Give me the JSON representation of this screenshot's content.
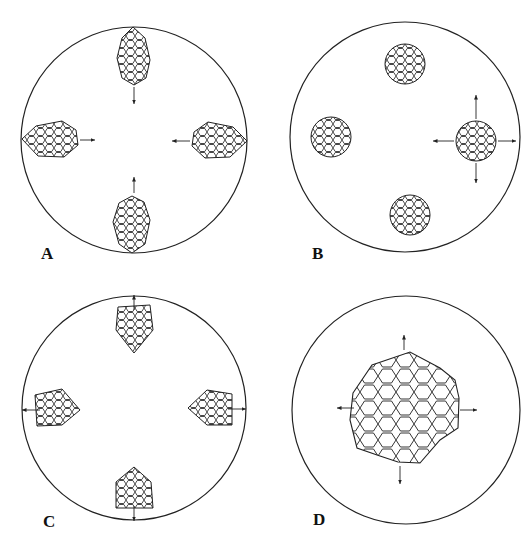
{
  "figure": {
    "panels": [
      {
        "label": "A",
        "description": "Four elongated cell clusters at the rim, oriented inward, arrows pointing toward center",
        "arrow_direction": "inward"
      },
      {
        "label": "B",
        "description": "Four rounded cell clusters inside the circle; right cluster shows radial arrows in four directions",
        "arrow_direction": "radial"
      },
      {
        "label": "C",
        "description": "Four pointed cell clusters with tips toward center, arrows pointing outward toward rim",
        "arrow_direction": "outward"
      },
      {
        "label": "D",
        "description": "Single large central cell mass with arrows pointing outward in four directions",
        "arrow_direction": "radial"
      }
    ],
    "colors": {
      "line": "#222222",
      "background": "#ffffff"
    }
  }
}
